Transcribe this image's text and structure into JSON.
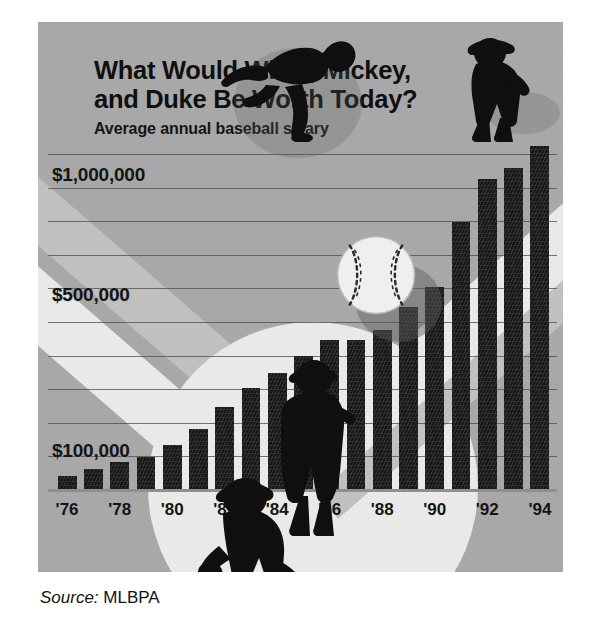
{
  "header": {
    "title": "What Would Willie, Mickey, and Duke Be Worth Today?",
    "subtitle": "Average annual baseball salary"
  },
  "source": {
    "label": "Source:",
    "value": "MLBPA"
  },
  "colors": {
    "panel_background": "#a9a9a9",
    "bar": "#141414",
    "gridline": "#4a4a4a",
    "text": "#111111",
    "page_background": "#ffffff",
    "deco_light": "#ececeb"
  },
  "chart_data": {
    "type": "bar",
    "title": "What Would Willie, Mickey, and Duke Be Worth Today?",
    "subtitle": "Average annual baseball salary",
    "xlabel": "",
    "ylabel": "",
    "grid": true,
    "legend": "none",
    "categories": [
      "'76",
      "'77",
      "'78",
      "'79",
      "'80",
      "'81",
      "'82",
      "'83",
      "'84",
      "'85",
      "'86",
      "'87",
      "'88",
      "'89",
      "'90",
      "'91",
      "'92",
      "'93",
      "'94"
    ],
    "tick_labels": [
      "'76",
      "'78",
      "'80",
      "'82",
      "'84",
      "'86",
      "'88",
      "'90",
      "'92",
      "'94"
    ],
    "values": [
      51501,
      76066,
      99876,
      113558,
      143756,
      185651,
      241497,
      289194,
      329408,
      371571,
      412454,
      412520,
      438729,
      497254,
      578930,
      851492,
      1028667,
      1076089,
      1168263
    ],
    "ytick_labels": [
      "$100,000",
      "$500,000",
      "$1,000,000"
    ],
    "ytick_values": [
      100000,
      500000,
      1000000
    ],
    "ylim": [
      0,
      1200000
    ],
    "units": "US dollars",
    "series": [
      {
        "name": "Average annual baseball salary",
        "values": [
          51501,
          76066,
          99876,
          113558,
          143756,
          185651,
          241497,
          289194,
          329408,
          371571,
          412454,
          412520,
          438729,
          497254,
          578930,
          851492,
          1028667,
          1076089,
          1168263
        ]
      }
    ]
  },
  "icons": {
    "baseball": "baseball-icon",
    "runner": "running-player-silhouette",
    "batter": "standing-player-silhouette",
    "catcher": "crouching-catcher-silhouette",
    "sitting": "sitting-player-silhouette"
  }
}
